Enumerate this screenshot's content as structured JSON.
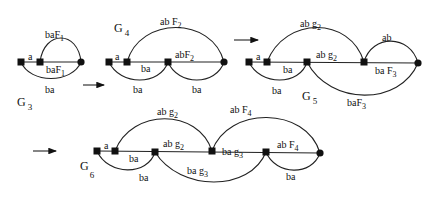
{
  "diagram": {
    "graphs": [
      {
        "name": "G",
        "index": "3",
        "edge_labels": {
          "a": "a",
          "top_arc": {
            "base": "baF",
            "sub": "1"
          },
          "middle": {
            "base": "baF",
            "sub": "1"
          },
          "bottom_arc": "ba"
        }
      },
      {
        "name": "G",
        "index": "4",
        "edge_labels": {
          "a": "a",
          "top_arc": {
            "base": "ab F",
            "sub": "2"
          },
          "middle": {
            "base": "abF",
            "sub": "2"
          },
          "inner_ba": "ba",
          "bottom_arc_1": "ba",
          "bottom_arc_2": "ba"
        }
      },
      {
        "name": "G",
        "index": "5",
        "edge_labels": {
          "a": "a",
          "top_arc": {
            "base": "ab g",
            "sub": "2"
          },
          "middle": {
            "base": "ab g",
            "sub": "2"
          },
          "right_top_arc": "ab",
          "inner_ba": "ba",
          "right_middle": {
            "base": "ba F",
            "sub": "3"
          },
          "bottom_arc_1": "ba",
          "bottom_arc_2": {
            "base": "baF",
            "sub": "3"
          }
        }
      },
      {
        "name": "G",
        "index": "6",
        "edge_labels": {
          "a": "a",
          "top_arc_1": {
            "base": "ab g",
            "sub": "2"
          },
          "top_arc_2": {
            "base": "ab F",
            "sub": "4"
          },
          "middle_1": {
            "base": "ab g",
            "sub": "2"
          },
          "middle_2": {
            "base": "ab F",
            "sub": "4"
          },
          "inner_ba": "ba",
          "inner_ba_g3": {
            "base": "ba g",
            "sub": "3"
          },
          "bottom_arc_1": "ba",
          "bottom_arc_2": {
            "base": "ba g",
            "sub": "3"
          },
          "bottom_arc_3": "ba"
        }
      }
    ],
    "arrows": [
      "G3 to G4",
      "G4 to G5",
      "G5 to G6"
    ],
    "colors": {
      "stroke": "#222222",
      "background": "#ffffff"
    }
  }
}
